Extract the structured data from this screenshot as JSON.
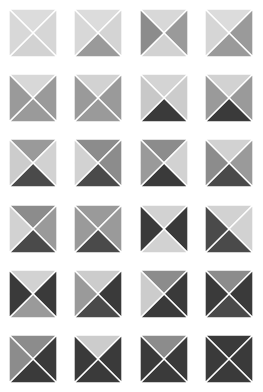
{
  "figure": {
    "rows": 6,
    "columns": 4,
    "tile_count": 24,
    "tile_size_px": 48,
    "diagonal_color": "#ffffff",
    "background_color": "#ffffff",
    "palette": {
      "lightest": "#dcdcdc",
      "light": "#d2d2d2",
      "light_mid": "#c8c8c8",
      "mid": "#9a9a9a",
      "mid_dark": "#8c8c8c",
      "dark": "#4a4a4a",
      "darkest": "#3a3a3a"
    }
  },
  "tiles": [
    {
      "id": "r1c1",
      "row": 1,
      "col": 1,
      "top": "#dcdcdc",
      "right": "#d6d6d6",
      "bottom": "#d2d2d2",
      "left": "#d8d8d8"
    },
    {
      "id": "r1c2",
      "row": 1,
      "col": 2,
      "top": "#dcdcdc",
      "right": "#d4d4d4",
      "bottom": "#9a9a9a",
      "left": "#d8d8d8"
    },
    {
      "id": "r1c3",
      "row": 1,
      "col": 3,
      "top": "#d8d8d8",
      "right": "#9a9a9a",
      "bottom": "#d2d2d2",
      "left": "#8c8c8c"
    },
    {
      "id": "r1c4",
      "row": 1,
      "col": 4,
      "top": "#dcdcdc",
      "right": "#9a9a9a",
      "bottom": "#9a9a9a",
      "left": "#d6d6d6"
    },
    {
      "id": "r2c1",
      "row": 2,
      "col": 1,
      "top": "#d8d8d8",
      "right": "#9a9a9a",
      "bottom": "#9a9a9a",
      "left": "#9a9a9a"
    },
    {
      "id": "r2c2",
      "row": 2,
      "col": 2,
      "top": "#d2d2d2",
      "right": "#9a9a9a",
      "bottom": "#9a9a9a",
      "left": "#9a9a9a"
    },
    {
      "id": "r2c3",
      "row": 2,
      "col": 3,
      "top": "#d4d4d4",
      "right": "#cccccc",
      "bottom": "#3a3a3a",
      "left": "#c8c8c8"
    },
    {
      "id": "r2c4",
      "row": 2,
      "col": 4,
      "top": "#d2d2d2",
      "right": "#9a9a9a",
      "bottom": "#3a3a3a",
      "left": "#9a9a9a"
    },
    {
      "id": "r3c1",
      "row": 3,
      "col": 1,
      "top": "#9a9a9a",
      "right": "#d2d2d2",
      "bottom": "#4a4a4a",
      "left": "#cccccc"
    },
    {
      "id": "r3c2",
      "row": 3,
      "col": 2,
      "top": "#8c8c8c",
      "right": "#8c8c8c",
      "bottom": "#4a4a4a",
      "left": "#d2d2d2"
    },
    {
      "id": "r3c3",
      "row": 3,
      "col": 3,
      "top": "#8c8c8c",
      "right": "#d2d2d2",
      "bottom": "#3a3a3a",
      "left": "#9a9a9a"
    },
    {
      "id": "r3c4",
      "row": 3,
      "col": 4,
      "top": "#d2d2d2",
      "right": "#9a9a9a",
      "bottom": "#4a4a4a",
      "left": "#8c8c8c"
    },
    {
      "id": "r4c1",
      "row": 4,
      "col": 1,
      "top": "#8c8c8c",
      "right": "#9a9a9a",
      "bottom": "#4a4a4a",
      "left": "#d2d2d2"
    },
    {
      "id": "r4c2",
      "row": 4,
      "col": 2,
      "top": "#9a9a9a",
      "right": "#9a9a9a",
      "bottom": "#4a4a4a",
      "left": "#9a9a9a"
    },
    {
      "id": "r4c3",
      "row": 4,
      "col": 3,
      "top": "#d2d2d2",
      "right": "#3a3a3a",
      "bottom": "#d2d2d2",
      "left": "#3a3a3a"
    },
    {
      "id": "r4c4",
      "row": 4,
      "col": 4,
      "top": "#d2d2d2",
      "right": "#d2d2d2",
      "bottom": "#4a4a4a",
      "left": "#4a4a4a"
    },
    {
      "id": "r5c1",
      "row": 5,
      "col": 1,
      "top": "#d2d2d2",
      "right": "#3a3a3a",
      "bottom": "#9a9a9a",
      "left": "#3a3a3a"
    },
    {
      "id": "r5c2",
      "row": 5,
      "col": 2,
      "top": "#cccccc",
      "right": "#3a3a3a",
      "bottom": "#4a4a4a",
      "left": "#9a9a9a"
    },
    {
      "id": "r5c3",
      "row": 5,
      "col": 3,
      "top": "#8c8c8c",
      "right": "#3a3a3a",
      "bottom": "#3a3a3a",
      "left": "#cccccc"
    },
    {
      "id": "r5c4",
      "row": 5,
      "col": 4,
      "top": "#8c8c8c",
      "right": "#3a3a3a",
      "bottom": "#4a4a4a",
      "left": "#3a3a3a"
    },
    {
      "id": "r6c1",
      "row": 6,
      "col": 1,
      "top": "#8c8c8c",
      "right": "#3a3a3a",
      "bottom": "#3a3a3a",
      "left": "#8c8c8c"
    },
    {
      "id": "r6c2",
      "row": 6,
      "col": 2,
      "top": "#cccccc",
      "right": "#3a3a3a",
      "bottom": "#3a3a3a",
      "left": "#3a3a3a"
    },
    {
      "id": "r6c3",
      "row": 6,
      "col": 3,
      "top": "#8c8c8c",
      "right": "#3a3a3a",
      "bottom": "#3a3a3a",
      "left": "#3a3a3a"
    },
    {
      "id": "r6c4",
      "row": 6,
      "col": 4,
      "top": "#3a3a3a",
      "right": "#3a3a3a",
      "bottom": "#3a3a3a",
      "left": "#3a3a3a"
    }
  ]
}
